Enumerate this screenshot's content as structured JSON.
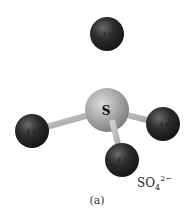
{
  "molecule": {
    "name": "sulfate ion",
    "central_atom": {
      "symbol": "S",
      "x": 107,
      "y": 110,
      "r": 22,
      "color": "#a8a8a8"
    },
    "ligands": [
      {
        "symbol": "O",
        "position": "top",
        "x": 107,
        "y": 34,
        "r": 17
      },
      {
        "symbol": "O",
        "position": "left",
        "x": 32,
        "y": 131,
        "r": 17
      },
      {
        "symbol": "O",
        "position": "right",
        "x": 163,
        "y": 124,
        "r": 17
      },
      {
        "symbol": "O",
        "position": "bottom",
        "x": 122,
        "y": 160,
        "r": 17
      }
    ],
    "oxygen_color": "#2a2a2a",
    "bond_color": "#b5b5b5"
  },
  "formula": {
    "base": "SO",
    "subscript": "4",
    "superscript": "2−"
  },
  "caption": "(a)"
}
